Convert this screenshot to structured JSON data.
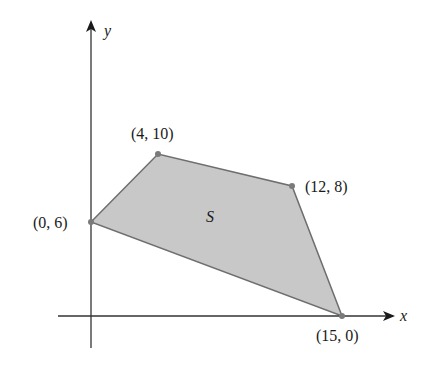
{
  "figure": {
    "region_label": "S",
    "axes": {
      "x_label": "x",
      "y_label": "y"
    },
    "vertices": [
      {
        "label": "(0, 6)",
        "x": 0,
        "y": 6
      },
      {
        "label": "(4, 10)",
        "x": 4,
        "y": 10
      },
      {
        "label": "(12, 8)",
        "x": 12,
        "y": 8
      },
      {
        "label": "(15, 0)",
        "x": 15,
        "y": 0
      }
    ],
    "colors": {
      "fill": "#c8c8c8",
      "edge": "#6e6e6e",
      "axis": "#333333",
      "text": "#1a1a1a"
    }
  }
}
